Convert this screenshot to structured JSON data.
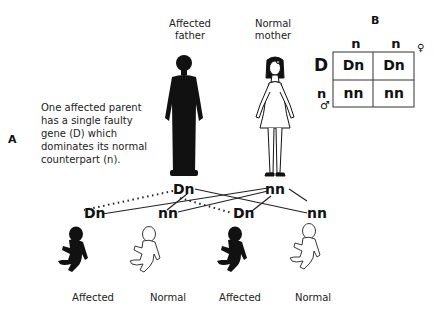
{
  "panels": {
    "a": "A",
    "b": "B"
  },
  "description": {
    "lines": [
      "One affected parent",
      "has a single faulty",
      "gene (D) which",
      "dominates its normal",
      "counterpart (n)."
    ]
  },
  "parents": {
    "father": {
      "line1": "Affected",
      "line2": "father",
      "genotype": "Dn",
      "status": "affected"
    },
    "mother": {
      "line1": "Normal",
      "line2": "mother",
      "genotype": "nn",
      "status": "normal"
    }
  },
  "children": [
    {
      "genotype": "Dn",
      "label": "Affected",
      "status": "affected"
    },
    {
      "genotype": "nn",
      "label": "Normal",
      "status": "normal"
    },
    {
      "genotype": "Dn",
      "label": "Affected",
      "status": "affected"
    },
    {
      "genotype": "nn",
      "label": "Normal",
      "status": "normal"
    }
  ],
  "punnett": {
    "col_headers": [
      "n",
      "n"
    ],
    "row_headers": [
      "D",
      "n"
    ],
    "cells": [
      [
        "Dn",
        "Dn"
      ],
      [
        "nn",
        "nn"
      ]
    ],
    "female_symbol": "♀",
    "male_symbol": "♂"
  },
  "colors": {
    "affected": "#111111",
    "normal": "#ffffff",
    "line": "#222222"
  }
}
